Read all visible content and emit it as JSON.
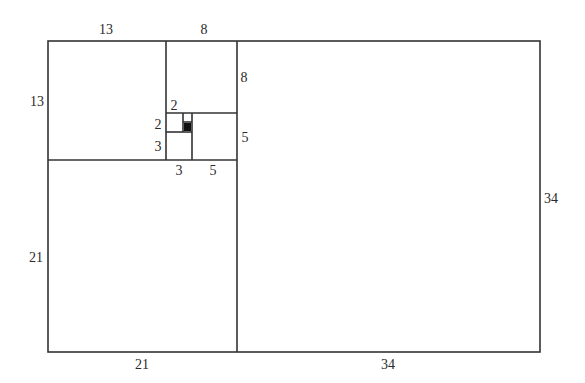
{
  "diagram": {
    "line_color": "#333333",
    "fill_color": "#111111",
    "labels": {
      "top_13": "13",
      "top_8": "8",
      "left_13": "13",
      "left_21": "21",
      "right_8": "8",
      "right_5": "5",
      "inner_2_top": "2",
      "inner_2_left": "2",
      "inner_3_left": "3",
      "inner_3_bottom": "3",
      "inner_5_bottom": "5",
      "bottom_21": "21",
      "bottom_34": "34",
      "right_34": "34"
    }
  }
}
